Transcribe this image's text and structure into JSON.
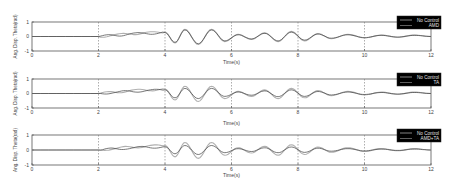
{
  "chart_data": [
    {
      "type": "line",
      "title": "",
      "xlabel": "Time(s)",
      "ylabel": "Ang. Disp. Theta(rad)",
      "xlim": [
        0,
        12
      ],
      "ylim": [
        -1,
        1
      ],
      "xticks": [
        0,
        2,
        4,
        6,
        8,
        10,
        12
      ],
      "yticks": [
        -1,
        0,
        1
      ],
      "grid": "x-major",
      "legend": {
        "position": "upper-right",
        "background": "#000000",
        "entries": [
          "No Control",
          "AMD"
        ]
      },
      "series": [
        {
          "name": "No Control",
          "color": "#b0b0b0",
          "x": [
            0,
            2,
            2.5,
            3,
            3.5,
            4,
            4.3,
            4.6,
            5,
            5.4,
            5.8,
            6.2,
            6.6,
            7,
            7.4,
            7.8,
            8.2,
            8.6,
            9,
            9.5,
            10,
            10.5,
            11,
            11.5,
            12
          ],
          "y": [
            0,
            0,
            0.1,
            0.2,
            0.25,
            0.3,
            -0.45,
            0.5,
            -0.55,
            0.5,
            -0.35,
            0.15,
            -0.2,
            0.25,
            -0.35,
            0.35,
            -0.3,
            0.2,
            -0.15,
            0.15,
            -0.1,
            0.1,
            -0.05,
            0.1,
            0
          ]
        },
        {
          "name": "AMD",
          "color": "#404040",
          "x": [
            0,
            2,
            2.5,
            3,
            3.5,
            4,
            4.3,
            4.6,
            5,
            5.4,
            5.8,
            6.2,
            6.6,
            7,
            7.4,
            7.8,
            8.2,
            8.6,
            9,
            9.5,
            10,
            10.5,
            11,
            11.5,
            12
          ],
          "y": [
            0,
            0,
            0.08,
            0.18,
            0.22,
            0.27,
            -0.4,
            0.45,
            -0.5,
            0.45,
            -0.3,
            0.12,
            -0.17,
            0.22,
            -0.3,
            0.3,
            -0.25,
            0.17,
            -0.12,
            0.12,
            -0.08,
            0.08,
            -0.04,
            0.08,
            0
          ]
        }
      ]
    },
    {
      "type": "line",
      "title": "",
      "xlabel": "Time(s)",
      "ylabel": "Ang. Disp. Theta(rad)",
      "xlim": [
        0,
        12
      ],
      "ylim": [
        -1,
        1
      ],
      "xticks": [
        0,
        2,
        4,
        6,
        8,
        10,
        12
      ],
      "yticks": [
        -1,
        0,
        1
      ],
      "grid": "x-major",
      "legend": {
        "position": "upper-right",
        "background": "#000000",
        "entries": [
          "No Control",
          "TA"
        ]
      },
      "series": [
        {
          "name": "No Control",
          "color": "#b0b0b0",
          "x": [
            0,
            2,
            2.5,
            3,
            3.5,
            4,
            4.3,
            4.6,
            5,
            5.4,
            5.8,
            6.2,
            6.6,
            7,
            7.4,
            7.8,
            8.2,
            8.6,
            9,
            9.5,
            10,
            10.5,
            11,
            11.5,
            12
          ],
          "y": [
            0,
            0,
            0.1,
            0.2,
            0.25,
            0.3,
            -0.45,
            0.5,
            -0.55,
            0.5,
            -0.35,
            0.15,
            -0.2,
            0.25,
            -0.35,
            0.35,
            -0.3,
            0.2,
            -0.15,
            0.15,
            -0.1,
            0.1,
            -0.05,
            0.1,
            0
          ]
        },
        {
          "name": "TA",
          "color": "#404040",
          "x": [
            0,
            2,
            2.5,
            3,
            3.5,
            4,
            4.3,
            4.6,
            5,
            5.4,
            5.8,
            6.2,
            6.6,
            7,
            7.4,
            7.8,
            8.2,
            8.6,
            9,
            9.5,
            10,
            10.5,
            11,
            11.5,
            12
          ],
          "y": [
            0,
            0,
            0.08,
            0.15,
            0.2,
            0.25,
            -0.3,
            0.35,
            -0.35,
            0.35,
            -0.2,
            0.1,
            -0.12,
            0.18,
            -0.22,
            0.25,
            -0.2,
            0.14,
            -0.1,
            0.1,
            -0.07,
            0.07,
            -0.04,
            0.07,
            0
          ]
        }
      ]
    },
    {
      "type": "line",
      "title": "",
      "xlabel": "Time(s)",
      "ylabel": "Ang. Disp. Theta(rad)",
      "xlim": [
        0,
        12
      ],
      "ylim": [
        -1,
        1
      ],
      "xticks": [
        0,
        2,
        4,
        6,
        8,
        10,
        12
      ],
      "yticks": [
        -1,
        0,
        1
      ],
      "grid": "x-major",
      "legend": {
        "position": "upper-right",
        "background": "#000000",
        "entries": [
          "No Control",
          "AMD+TA"
        ]
      },
      "series": [
        {
          "name": "No Control",
          "color": "#b0b0b0",
          "x": [
            0,
            2,
            2.5,
            3,
            3.5,
            4,
            4.3,
            4.6,
            5,
            5.4,
            5.8,
            6.2,
            6.6,
            7,
            7.4,
            7.8,
            8.2,
            8.6,
            9,
            9.5,
            10,
            10.5,
            11,
            11.5,
            12
          ],
          "y": [
            0,
            0,
            0.1,
            0.2,
            0.25,
            0.3,
            -0.45,
            0.5,
            -0.55,
            0.5,
            -0.35,
            0.15,
            -0.2,
            0.25,
            -0.35,
            0.35,
            -0.3,
            0.2,
            -0.15,
            0.15,
            -0.1,
            0.1,
            -0.05,
            0.1,
            0
          ]
        },
        {
          "name": "AMD+TA",
          "color": "#404040",
          "x": [
            0,
            2,
            2.5,
            3,
            3.5,
            4,
            4.3,
            4.6,
            5,
            5.4,
            5.8,
            6.2,
            6.6,
            7,
            7.4,
            7.8,
            8.2,
            8.6,
            9,
            9.5,
            10,
            10.5,
            11,
            11.5,
            12
          ],
          "y": [
            0,
            0,
            0.07,
            0.14,
            0.18,
            0.22,
            -0.25,
            0.3,
            -0.3,
            0.3,
            -0.18,
            0.09,
            -0.1,
            0.15,
            -0.18,
            0.2,
            -0.16,
            0.12,
            -0.08,
            0.09,
            -0.06,
            0.06,
            -0.03,
            0.06,
            0
          ]
        }
      ]
    }
  ],
  "panels": [
    {
      "ylabel": "Ang. Disp. Theta(rad)",
      "xlabel": "Time(s)",
      "legend": [
        "No Control",
        "AMD"
      ]
    },
    {
      "ylabel": "Ang. Disp. Theta(rad)",
      "xlabel": "Time(s)",
      "legend": [
        "No Control",
        "TA"
      ]
    },
    {
      "ylabel": "Ang. Disp. Theta(rad)",
      "xlabel": "Time(s)",
      "legend": [
        "No Control",
        "AMD+TA"
      ]
    }
  ],
  "colors": {
    "axis": "#555555",
    "grid": "#777777",
    "legend_bg": "#000000",
    "legend_text": "#e0e0e0",
    "no_control": "#b0b0b0",
    "controlled": "#404040"
  }
}
